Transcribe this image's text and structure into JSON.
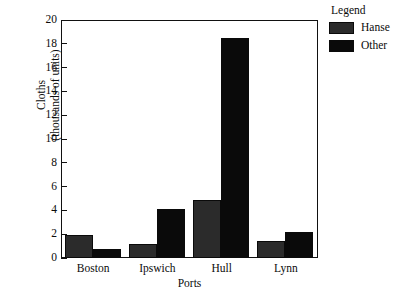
{
  "chart_data": {
    "type": "bar",
    "title": "",
    "xlabel": "Ports",
    "ylabel_line1": "Cloths",
    "ylabel_line2": "(thousands of units)",
    "categories": [
      "Boston",
      "Ipswich",
      "Hull",
      "Lynn"
    ],
    "series": [
      {
        "name": "Hanse",
        "color": "#2b2b2b",
        "values": [
          1.9,
          1.2,
          4.85,
          1.45
        ]
      },
      {
        "name": "Other",
        "color": "#0a0a0a",
        "values": [
          0.75,
          4.15,
          18.5,
          2.15
        ]
      }
    ],
    "ylim": [
      0,
      20
    ],
    "yticks": [
      0,
      2,
      4,
      6,
      8,
      10,
      12,
      14,
      16,
      18,
      20
    ],
    "ytick_labels": [
      "0",
      "2",
      "4",
      "6",
      "8",
      "10",
      "12",
      "14",
      "16",
      "18",
      "20"
    ],
    "grid": false,
    "legend_position": "right",
    "legend_title": "Legend"
  },
  "legend": {
    "title": "Legend",
    "entries": [
      {
        "label": "Hanse",
        "color": "#2b2b2b"
      },
      {
        "label": "Other",
        "color": "#0a0a0a"
      }
    ]
  },
  "axes": {
    "x_title": "Ports",
    "y_title_line1": "Cloths",
    "y_title_line2": "(thousands of units)"
  }
}
